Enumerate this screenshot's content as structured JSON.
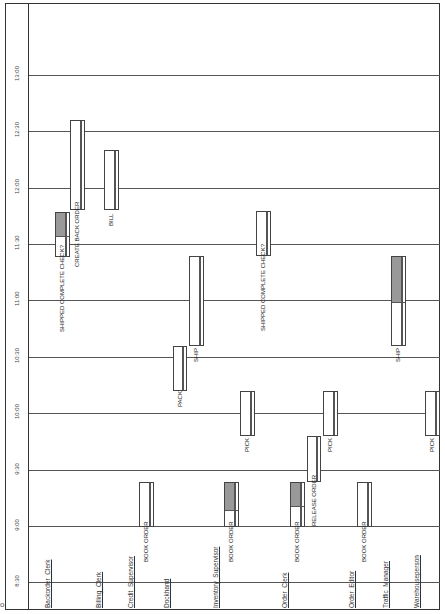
{
  "chart_data": {
    "type": "gantt-swimlane",
    "orientation": "rotated 90deg: time axis vertical (bottom=early), lanes horizontal",
    "time_axis": {
      "ticks": [
        "8:30",
        "9:00",
        "9:30",
        "10:00",
        "10:30",
        "11:00",
        "11:30",
        "12:00",
        "12:30",
        "13:00"
      ],
      "tick_y": [
        582,
        526,
        470,
        413,
        357,
        300,
        244,
        188,
        131,
        75
      ]
    },
    "lanes": [
      {
        "name": "Backorder_Clerk",
        "x": 44
      },
      {
        "name": "Billing_Clerk",
        "x": 95
      },
      {
        "name": "Credit_Supervisor",
        "x": 127
      },
      {
        "name": "Dockhand",
        "x": 163
      },
      {
        "name": "Inventory_Supervisor",
        "x": 212
      },
      {
        "name": "Order_Clerk",
        "x": 281
      },
      {
        "name": "Order_Editor",
        "x": 348
      },
      {
        "name": "Traffic_Manager",
        "x": 382
      },
      {
        "name": "Warehouseperson",
        "x": 413
      }
    ],
    "tasks": [
      {
        "lane": "Backorder_Clerk",
        "label": "SHIPPED COMPLETE CHECK?",
        "start": "11:15",
        "end": "11:40",
        "x": 55,
        "y": 212,
        "w": 15,
        "h": 45,
        "shaded": 0.5,
        "divider_frac": 0.6
      },
      {
        "lane": "Backorder_Clerk",
        "label": "CREATE BACK ORDER",
        "start": "11:40",
        "end": "12:40",
        "x": 70,
        "y": 120,
        "w": 15,
        "h": 90,
        "shaded": 0,
        "divider_frac": 0.6
      },
      {
        "lane": "Billing_Clerk",
        "label": "BILL",
        "start": "11:40",
        "end": "12:20",
        "x": 104,
        "y": 150,
        "w": 15,
        "h": 60,
        "shaded": 0,
        "divider_frac": 0.6
      },
      {
        "lane": "Credit_Supervisor",
        "label": "BOOK ORDER",
        "start": "9:00",
        "end": "9:30",
        "x": 139,
        "y": 482,
        "w": 15,
        "h": 45,
        "shaded": 0,
        "divider_frac": 0.6
      },
      {
        "lane": "Dockhand",
        "label": "PACK",
        "start": "10:15",
        "end": "10:45",
        "x": 173,
        "y": 346,
        "w": 14,
        "h": 45,
        "shaded": 0,
        "divider_frac": 0.6
      },
      {
        "lane": "Dockhand",
        "label": "SHIP",
        "start": "10:45",
        "end": "11:45",
        "x": 189,
        "y": 256,
        "w": 15,
        "h": 90,
        "shaded": 0,
        "divider_frac": 0.6
      },
      {
        "lane": "Inventory_Supervisor",
        "label": "BOOK ORDER",
        "start": "9:00",
        "end": "9:30",
        "x": 224,
        "y": 482,
        "w": 15,
        "h": 45,
        "shaded": 0.6,
        "divider_frac": 0.6
      },
      {
        "lane": "Inventory_Supervisor",
        "label": "PICK",
        "start": "9:45",
        "end": "10:15",
        "x": 240,
        "y": 391,
        "w": 15,
        "h": 45,
        "shaded": 0,
        "divider_frac": 0.6
      },
      {
        "lane": "Order_Clerk",
        "label": "SHIPPED COMPLETE CHECK?",
        "start": "11:15",
        "end": "11:40",
        "x": 256,
        "y": 211,
        "w": 15,
        "h": 45,
        "shaded": 0,
        "divider_frac": 0.6
      },
      {
        "lane": "Order_Clerk",
        "label": "BOOK ORDER",
        "start": "9:00",
        "end": "9:30",
        "x": 290,
        "y": 482,
        "w": 15,
        "h": 45,
        "shaded": 0.5,
        "divider_frac": 0.6
      },
      {
        "lane": "Order_Clerk",
        "label": "RELEASE ORDER",
        "start": "9:30",
        "end": "9:55",
        "x": 307,
        "y": 436,
        "w": 14,
        "h": 46,
        "shaded": 0,
        "divider_frac": 0.6
      },
      {
        "lane": "Order_Clerk",
        "label": "PICK",
        "start": "9:45",
        "end": "10:15",
        "x": 323,
        "y": 391,
        "w": 15,
        "h": 45,
        "shaded": 0,
        "divider_frac": 0.6
      },
      {
        "lane": "Order_Editor",
        "label": "BOOK ORDER",
        "start": "9:00",
        "end": "9:30",
        "x": 357,
        "y": 482,
        "w": 15,
        "h": 45,
        "shaded": 0,
        "divider_frac": 0.6
      },
      {
        "lane": "Traffic_Manager",
        "label": "SHIP",
        "start": "10:45",
        "end": "11:45",
        "x": 391,
        "y": 256,
        "w": 15,
        "h": 90,
        "shaded": 0.5,
        "divider_frac": 0.6
      },
      {
        "lane": "Warehouseperson",
        "label": "PICK",
        "start": "9:45",
        "end": "10:15",
        "x": 425,
        "y": 391,
        "w": 15,
        "h": 45,
        "shaded": 0,
        "divider_frac": 0.6
      }
    ],
    "title": "",
    "xlabel": "",
    "ylabel": ""
  },
  "corner_mark": "o"
}
